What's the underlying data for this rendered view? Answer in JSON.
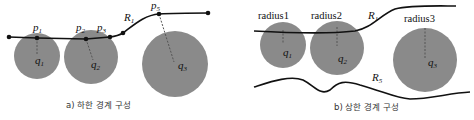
{
  "panel_a": {
    "caption": "a) 하한 경계 구성",
    "labels": {
      "p1": "p",
      "p1_sub": "1",
      "p2": "p",
      "p2_sub": "2",
      "p3": "p",
      "p3_sub": "3",
      "p5": "p",
      "p5_sub": "5",
      "R1": "R",
      "R1_sub": "1",
      "q1": "q",
      "q1_sub": "1",
      "q2": "q",
      "q2_sub": "2",
      "q3": "q",
      "q3_sub": "3"
    }
  },
  "panel_b": {
    "caption": "b) 상한 경계 구성",
    "labels": {
      "radius1": "radius1",
      "radius2": "radius2",
      "radius3": "radius3",
      "R1": "R",
      "R1_sub": "1",
      "R5": "R",
      "R5_sub": "5",
      "q1": "q",
      "q1_sub": "1",
      "q2": "q",
      "q2_sub": "2",
      "q3": "q",
      "q3_sub": "3"
    }
  },
  "colors": {
    "circle": "#8a8a8a",
    "line": "#111111",
    "background": "#ffffff"
  }
}
